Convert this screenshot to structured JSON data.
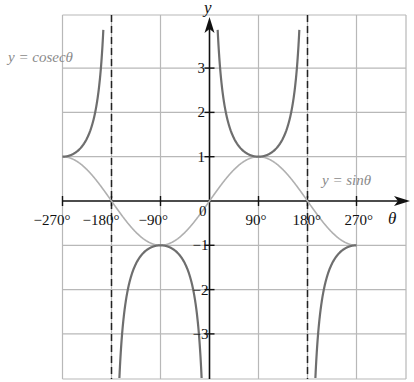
{
  "chart_data": {
    "type": "line",
    "title": "",
    "xlabel": "θ",
    "ylabel": "y",
    "xlim": [
      -270,
      270
    ],
    "ylim": [
      -4,
      4.2
    ],
    "grid": true,
    "x_ticks": [
      -270,
      -180,
      -90,
      90,
      180,
      270
    ],
    "x_tick_labels": [
      "−270°",
      "−180°",
      "−90°",
      "90°",
      "180°",
      "270°"
    ],
    "y_ticks": [
      3,
      2,
      1,
      -1,
      -2,
      -3
    ],
    "y_tick_labels": [
      "3",
      "2",
      "1",
      "−1",
      "−2",
      "−3"
    ],
    "origin_label": "0",
    "asymptotes": [
      -180,
      0,
      180
    ],
    "series": [
      {
        "name": "y = sinθ",
        "color": "#b0b0b0",
        "function": "sin",
        "x": [
          -270,
          -225,
          -180,
          -135,
          -90,
          -45,
          0,
          45,
          90,
          135,
          180,
          225,
          270
        ],
        "values": [
          1,
          0.71,
          0,
          -0.71,
          -1,
          -0.71,
          0,
          0.71,
          1,
          0.71,
          0,
          -0.71,
          -1
        ]
      },
      {
        "name": "y = cosecθ",
        "color": "#6e6e6e",
        "function": "cosec",
        "x": [
          -270,
          -225,
          -200,
          -90,
          -45,
          -20,
          20,
          45,
          90,
          135,
          160,
          200,
          225,
          270
        ],
        "values": [
          1,
          1.41,
          2.92,
          -1,
          -1.41,
          -2.92,
          2.92,
          1.41,
          1,
          1.41,
          2.92,
          -2.92,
          -1.41,
          -1
        ]
      }
    ],
    "annotations": [
      {
        "text": "y = cosecθ",
        "near": "top-left"
      },
      {
        "text": "y = sinθ",
        "near": "right, above axis"
      }
    ]
  },
  "labels": {
    "y_axis": "y",
    "x_axis": "θ",
    "origin": "0",
    "cosec_label": "y = cosecθ",
    "sin_label": "y = sinθ"
  }
}
